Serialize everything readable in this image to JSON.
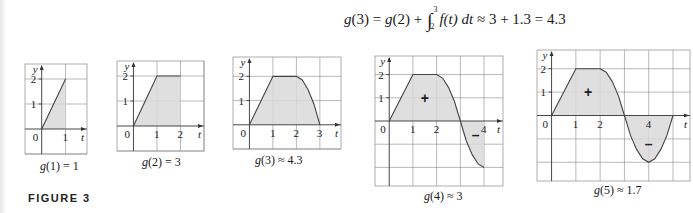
{
  "equation": {
    "lhs_fn": "g",
    "lhs_arg": "(3)",
    "eq1": " = ",
    "g2_fn": "g",
    "g2_arg": "(2)",
    "plus": " + ",
    "integral_symbol": "∫",
    "lower_limit": "2",
    "upper_limit": "3",
    "integrand": "f(t) dt",
    "approx1": " ≈ 3 + 1.3 = 4.3"
  },
  "figure_label": "FIGURE 3",
  "chart_data": [
    {
      "type": "area",
      "title": "",
      "caption": "g(1) = 1",
      "caption_fn": "g",
      "caption_rest": "(1) = 1",
      "xlabel": "t",
      "ylabel": "y",
      "xlim": [
        -0.7,
        1.9
      ],
      "ylim": [
        -1.0,
        2.6
      ],
      "x_ticks": [
        "0",
        "1"
      ],
      "y_ticks": [
        "1",
        "2"
      ],
      "curve_points": [
        [
          0,
          0
        ],
        [
          1,
          2
        ]
      ],
      "shaded_interval": [
        0,
        1
      ],
      "signs": []
    },
    {
      "type": "area",
      "title": "",
      "caption": "g(2) = 3",
      "caption_fn": "g",
      "caption_rest": "(2) = 3",
      "xlabel": "t",
      "ylabel": "y",
      "xlim": [
        -0.7,
        3.0
      ],
      "ylim": [
        -1.0,
        2.6
      ],
      "x_ticks": [
        "0",
        "1",
        "2"
      ],
      "y_ticks": [
        "1",
        "2"
      ],
      "curve_points": [
        [
          0,
          0
        ],
        [
          1,
          2
        ],
        [
          2,
          2
        ]
      ],
      "shaded_interval": [
        0,
        2
      ],
      "signs": []
    },
    {
      "type": "area",
      "title": "",
      "caption": "g(3) ≈ 4.3",
      "caption_fn": "g",
      "caption_rest": "(3) ≈ 4.3",
      "xlabel": "t",
      "ylabel": "y",
      "xlim": [
        -0.7,
        3.9
      ],
      "ylim": [
        -1.0,
        2.8
      ],
      "x_ticks": [
        "0",
        "1",
        "2",
        "3"
      ],
      "y_ticks": [
        "1",
        "2"
      ],
      "curve_points": [
        [
          0,
          0
        ],
        [
          1,
          2
        ],
        [
          2,
          2
        ],
        [
          2.25,
          1.85
        ],
        [
          2.5,
          1.45
        ],
        [
          2.75,
          0.85
        ],
        [
          3,
          0
        ]
      ],
      "shaded_interval": [
        0,
        3
      ],
      "signs": []
    },
    {
      "type": "area",
      "title": "",
      "caption": "g(4) ≈ 3",
      "caption_fn": "g",
      "caption_rest": "(4) ≈ 3",
      "xlabel": "t",
      "ylabel": "y",
      "xlim": [
        -0.6,
        4.8
      ],
      "ylim": [
        -2.8,
        2.8
      ],
      "x_ticks": [
        "0",
        "1",
        "2",
        "4"
      ],
      "y_ticks": [
        "1",
        "2"
      ],
      "curve_points": [
        [
          0,
          0
        ],
        [
          1,
          2
        ],
        [
          2,
          2
        ],
        [
          2.25,
          1.85
        ],
        [
          2.5,
          1.45
        ],
        [
          2.75,
          0.85
        ],
        [
          3,
          0
        ],
        [
          3.25,
          -0.85
        ],
        [
          3.5,
          -1.45
        ],
        [
          3.75,
          -1.85
        ],
        [
          4,
          -2
        ]
      ],
      "shaded_interval": [
        0,
        4
      ],
      "signs": [
        {
          "label": "+",
          "x": 1.5,
          "y": 1.0
        },
        {
          "label": "–",
          "x": 3.65,
          "y": -0.6
        }
      ]
    },
    {
      "type": "area",
      "title": "",
      "caption": "g(5) ≈ 1.7",
      "caption_fn": "g",
      "caption_rest": "(5) ≈ 1.7",
      "xlabel": "t",
      "ylabel": "y",
      "xlim": [
        -0.6,
        5.7
      ],
      "ylim": [
        -2.8,
        2.8
      ],
      "x_ticks": [
        "0",
        "1",
        "2",
        "4"
      ],
      "y_ticks": [
        "1",
        "2"
      ],
      "curve_points": [
        [
          0,
          0
        ],
        [
          1,
          2
        ],
        [
          2,
          2
        ],
        [
          2.25,
          1.85
        ],
        [
          2.5,
          1.45
        ],
        [
          2.75,
          0.85
        ],
        [
          3,
          0
        ],
        [
          3.25,
          -0.85
        ],
        [
          3.5,
          -1.45
        ],
        [
          3.75,
          -1.85
        ],
        [
          4,
          -2
        ],
        [
          4.25,
          -1.85
        ],
        [
          4.5,
          -1.45
        ],
        [
          4.75,
          -0.85
        ],
        [
          5,
          0
        ]
      ],
      "shaded_interval": [
        0,
        5
      ],
      "signs": [
        {
          "label": "+",
          "x": 1.5,
          "y": 1.0
        },
        {
          "label": "–",
          "x": 4.0,
          "y": -1.2
        }
      ]
    }
  ]
}
